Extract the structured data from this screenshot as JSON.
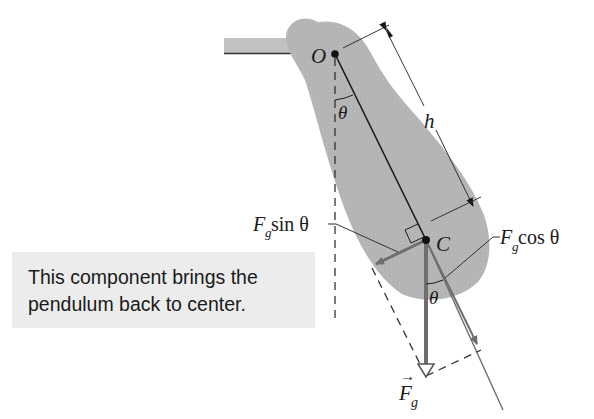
{
  "figure": {
    "labels": {
      "pivot": "O",
      "center_of_mass": "C",
      "angle_top": "θ",
      "angle_bottom": "θ",
      "distance": "h",
      "tangential_force_F": "F",
      "tangential_force_sub": "g",
      "tangential_force_rest": " sin θ",
      "radial_force_F": "F",
      "radial_force_sub": "g",
      "radial_force_rest": " cos θ",
      "gravity_F": "F",
      "gravity_sub": "g",
      "gravity_arrow": "→"
    },
    "callout": {
      "line1": "This component brings the",
      "line2": "pendulum back to center."
    },
    "colors": {
      "body_fill": "#b3b3b3",
      "ceiling_fill": "#c0c0c0",
      "line": "#1a1a1a",
      "force_vector": "#6e6e6e",
      "callout_bg": "#ececec"
    }
  }
}
